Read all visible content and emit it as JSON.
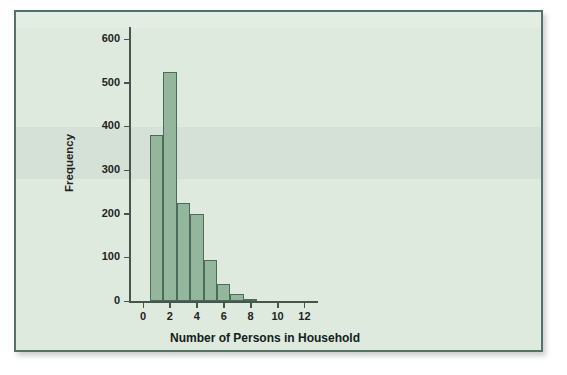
{
  "figure": {
    "background_color": "#ffffff",
    "card_background": "#dfeade",
    "card_border_color": "#54726a"
  },
  "chart_data": {
    "type": "bar",
    "title": "",
    "subtitle": "",
    "xlabel": "Number of Persons in Household",
    "ylabel": "Frequency",
    "categories": [
      "1",
      "2",
      "3",
      "4",
      "5",
      "6",
      "7",
      "8"
    ],
    "bin_edges": [
      0.5,
      1.5,
      2.5,
      3.5,
      4.5,
      5.5,
      6.5,
      7.5,
      8.5
    ],
    "values": [
      380,
      525,
      225,
      200,
      95,
      40,
      17,
      4
    ],
    "x": [
      1,
      2,
      3,
      4,
      5,
      6,
      7,
      8
    ],
    "xlim": [
      -0.6,
      13.0
    ],
    "ylim": [
      0,
      630
    ],
    "xticks": [
      0,
      2,
      4,
      6,
      8,
      10,
      12
    ],
    "xticklabels": [
      "0",
      "2",
      "4",
      "6",
      "8",
      "10",
      "12"
    ],
    "yticks": [
      0,
      100,
      200,
      300,
      400,
      500,
      600
    ],
    "yticklabels": [
      "0",
      "100",
      "200",
      "300",
      "400",
      "500",
      "600"
    ],
    "grid": false,
    "legend": null,
    "bar_fill_color": "#93b69d",
    "bar_edge_color": "#4d6b59",
    "axis_color": "#45564f"
  }
}
